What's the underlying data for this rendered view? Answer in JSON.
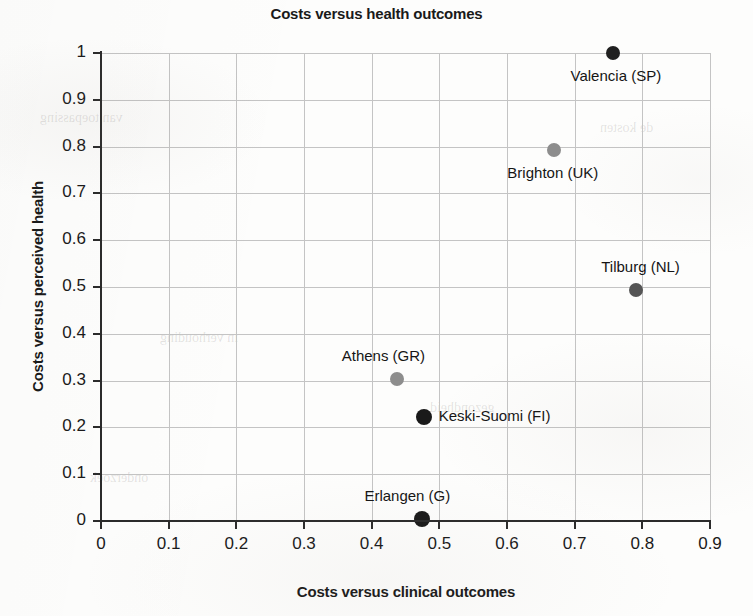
{
  "chart_data": {
    "type": "scatter",
    "title": "Costs versus health outcomes",
    "xlabel": "Costs versus clinical outcomes",
    "ylabel": "Costs versus perceived health",
    "xlim": [
      0,
      0.9
    ],
    "ylim": [
      0,
      1
    ],
    "grid": true,
    "legend": "none",
    "xticks": [
      "0",
      "0.1",
      "0.2",
      "0.3",
      "0.4",
      "0.5",
      "0.6",
      "0.7",
      "0.8",
      "0.9"
    ],
    "xtick_values": [
      0,
      0.1,
      0.2,
      0.3,
      0.4,
      0.5,
      0.6,
      0.7,
      0.8,
      0.9
    ],
    "yticks": [
      "0",
      "0.1",
      "0.2",
      "0.3",
      "0.4",
      "0.5",
      "0.6",
      "0.7",
      "0.8",
      "0.9",
      "1"
    ],
    "ytick_values": [
      0,
      0.1,
      0.2,
      0.3,
      0.4,
      0.5,
      0.6,
      0.7,
      0.8,
      0.9,
      1
    ],
    "points": [
      {
        "label": "Valencia (SP)",
        "x": 0.756,
        "y": 1.0,
        "color": "#202020",
        "radius": 7,
        "label_position": "below-right"
      },
      {
        "label": "Brighton (UK)",
        "x": 0.67,
        "y": 0.793,
        "color": "#8d8d8d",
        "radius": 7,
        "label_position": "below-left"
      },
      {
        "label": "Tilburg (NL)",
        "x": 0.791,
        "y": 0.493,
        "color": "#555555",
        "radius": 7,
        "label_position": "above-left"
      },
      {
        "label": "Athens (GR)",
        "x": 0.437,
        "y": 0.303,
        "color": "#8d8d8d",
        "radius": 7,
        "label_position": "above-left"
      },
      {
        "label": "Keski-Suomi (FI)",
        "x": 0.477,
        "y": 0.222,
        "color": "#1a1a1a",
        "radius": 8,
        "label_position": "right"
      },
      {
        "label": "Erlangen (G)",
        "x": 0.475,
        "y": 0.004,
        "color": "#1a1a1a",
        "radius": 8,
        "label_position": "above-left"
      }
    ]
  },
  "page_bleed": [
    {
      "text": "van toepassing",
      "left": 40,
      "top": 110,
      "size": 14
    },
    {
      "text": "de kosten",
      "left": 600,
      "top": 120,
      "size": 14
    },
    {
      "text": "in verhouding",
      "left": 160,
      "top": 330,
      "size": 14
    },
    {
      "text": "gezondheid",
      "left": 430,
      "top": 400,
      "size": 14
    },
    {
      "text": "onderzoek",
      "left": 90,
      "top": 470,
      "size": 14
    }
  ]
}
